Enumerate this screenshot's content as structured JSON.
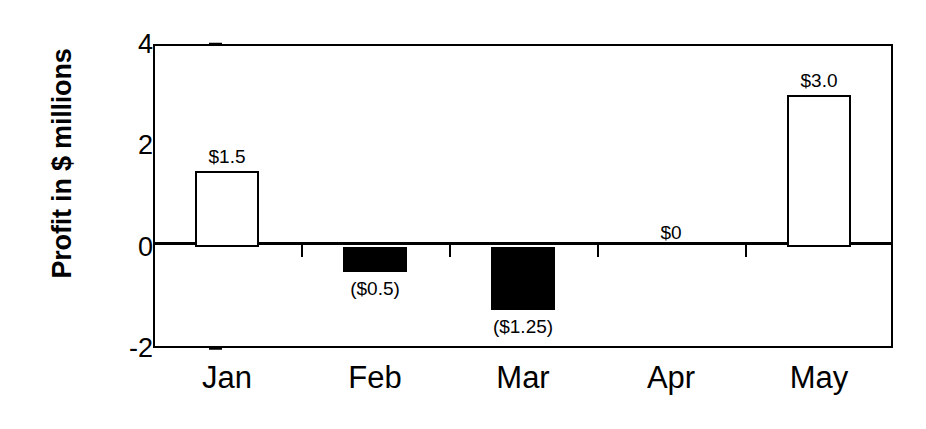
{
  "chart_data": {
    "type": "bar",
    "title": "",
    "xlabel": "",
    "ylabel": "Profit in $ millions",
    "categories": [
      "Jan",
      "Feb",
      "Mar",
      "Apr",
      "May"
    ],
    "values": [
      1.5,
      -0.5,
      -1.25,
      0,
      3.0
    ],
    "data_labels": [
      "$1.5",
      "($0.5)",
      "($1.25)",
      "$0",
      "$3.0"
    ],
    "bar_fill": [
      "white",
      "black",
      "black",
      "none",
      "white"
    ],
    "ylim": [
      -2,
      4
    ],
    "ytick_values": [
      4,
      2,
      0,
      -2
    ],
    "ytick_labels": [
      "4",
      "2",
      "0",
      "-2"
    ],
    "grid": false,
    "legend": "none",
    "zero_line": true,
    "colors": {
      "positive_fill": "#ffffff",
      "negative_fill": "#000000",
      "outline": "#000000",
      "background": "#ffffff"
    }
  }
}
